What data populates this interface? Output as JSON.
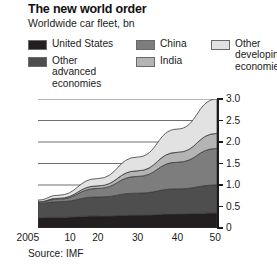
{
  "header": {
    "title": "The new world order",
    "subtitle": "Worldwide car fleet, bn"
  },
  "legend": {
    "items": [
      {
        "key": "united_states",
        "label": "United States",
        "color": "#231f20"
      },
      {
        "key": "other_advanced",
        "label": "Other advanced economies",
        "color": "#4e4e4e"
      },
      {
        "key": "china",
        "label": "China",
        "color": "#7d7d7d"
      },
      {
        "key": "india",
        "label": "India",
        "color": "#b4b4b4"
      },
      {
        "key": "other_developing",
        "label": "Other developing economies",
        "color": "#e2e2e2"
      }
    ]
  },
  "footer": {
    "source": "Source: IMF"
  },
  "chart_data": {
    "type": "area",
    "stacked": true,
    "title": "The new world order",
    "subtitle": "Worldwide car fleet, bn",
    "xlabel": "",
    "ylabel": "",
    "unit": "bn",
    "grid": true,
    "legend_position": "top",
    "x": [
      2005,
      2010,
      2020,
      2030,
      2040,
      2050
    ],
    "xtick_labels": [
      "2005",
      "10",
      "20",
      "30",
      "40",
      "50"
    ],
    "xlim": [
      2005,
      2050
    ],
    "ylim": [
      0,
      3.0
    ],
    "ytick_labels": [
      "0",
      "0.5",
      "1.0",
      "1.5",
      "2.0",
      "2.5",
      "3.0"
    ],
    "yticks": [
      0,
      0.5,
      1.0,
      1.5,
      2.0,
      2.5,
      3.0
    ],
    "series": [
      {
        "name": "United States",
        "color": "#231f20",
        "values": [
          0.24,
          0.25,
          0.28,
          0.3,
          0.33,
          0.35
        ]
      },
      {
        "name": "Other advanced economies",
        "color": "#4e4e4e",
        "values": [
          0.33,
          0.36,
          0.44,
          0.51,
          0.58,
          0.65
        ]
      },
      {
        "name": "China",
        "color": "#7d7d7d",
        "values": [
          0.03,
          0.06,
          0.2,
          0.39,
          0.62,
          0.85
        ]
      },
      {
        "name": "India",
        "color": "#b4b4b4",
        "values": [
          0.01,
          0.02,
          0.06,
          0.13,
          0.23,
          0.35
        ]
      },
      {
        "name": "Other developing economies",
        "color": "#e2e2e2",
        "values": [
          0.04,
          0.07,
          0.17,
          0.32,
          0.54,
          0.8
        ]
      }
    ],
    "totals": [
      0.65,
      0.76,
      1.15,
      1.65,
      2.3,
      3.0
    ],
    "annotations": []
  }
}
